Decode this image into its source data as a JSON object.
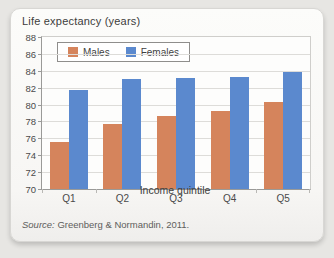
{
  "card": {
    "title": "Life expectancy (years)"
  },
  "chart_data": {
    "type": "bar",
    "title": "Life expectancy (years)",
    "categories": [
      "Q1",
      "Q2",
      "Q3",
      "Q4",
      "Q5"
    ],
    "series": [
      {
        "name": "Males",
        "color": "#d5845c",
        "values": [
          75.6,
          77.7,
          78.6,
          79.2,
          80.3
        ]
      },
      {
        "name": "Females",
        "color": "#5b89ce",
        "values": [
          81.7,
          83.0,
          83.2,
          83.3,
          83.9
        ]
      }
    ],
    "xlabel": "Income quintile",
    "ylabel": "Life expectancy (years)",
    "ylim": [
      70,
      88
    ],
    "ytick_step": 2,
    "grid": true,
    "legend_position": "top-left",
    "bar_width_px": 19,
    "plot": {
      "width": 268,
      "height": 152
    }
  },
  "source": {
    "prefix": "Source:",
    "text": " Greenberg & Normandin, 2011."
  }
}
